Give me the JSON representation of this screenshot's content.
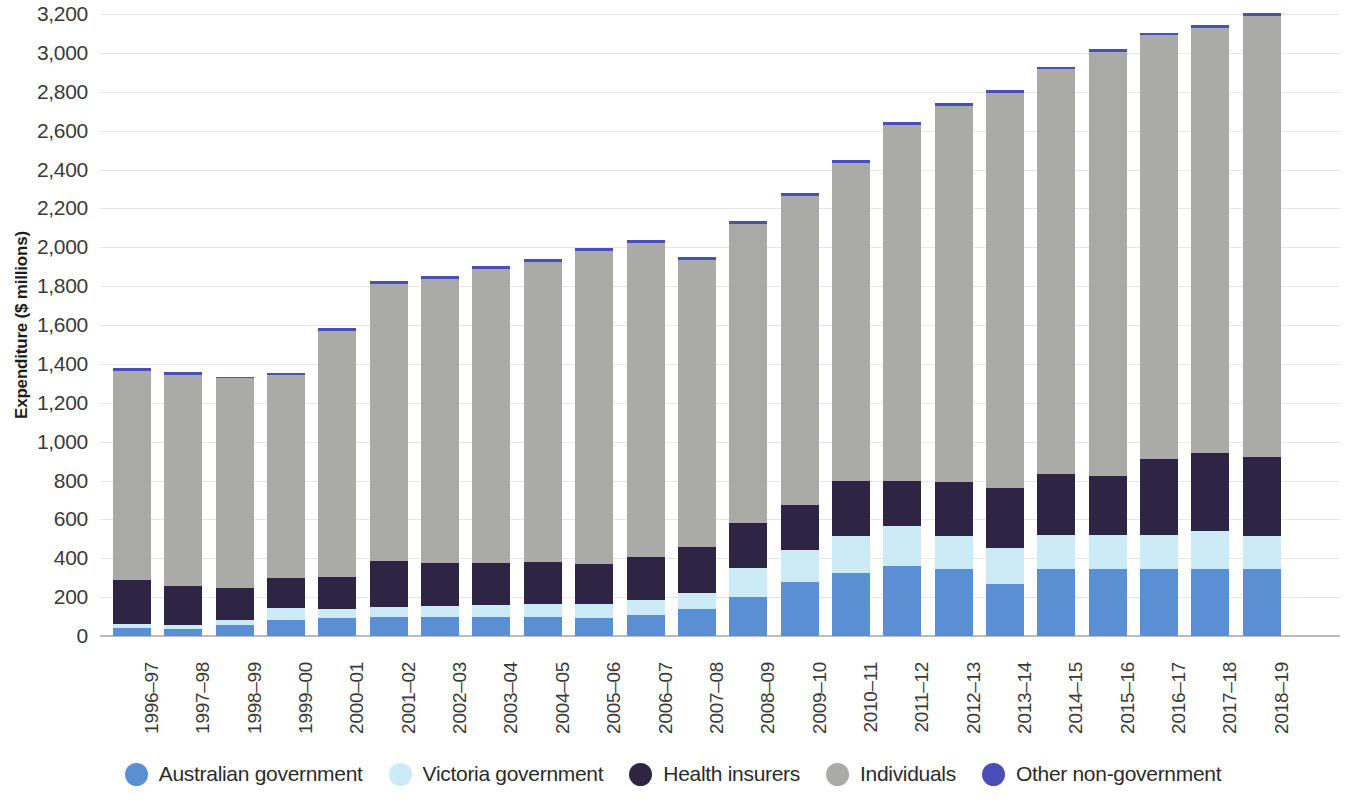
{
  "chart_data": {
    "type": "bar",
    "stacked": true,
    "title": "",
    "xlabel": "",
    "ylabel": "Expenditure ($ millions)",
    "ylim": [
      0,
      3200
    ],
    "ytick_step": 200,
    "ytick_labels": [
      "0",
      "200",
      "400",
      "600",
      "800",
      "1,000",
      "1,200",
      "1,400",
      "1,600",
      "1,800",
      "2,000",
      "2,200",
      "2,400",
      "2,600",
      "2,800",
      "3,000",
      "3,200"
    ],
    "grid": true,
    "legend_position": "bottom",
    "categories": [
      "1996–97",
      "1997–98",
      "1998–99",
      "1999–00",
      "2000–01",
      "2001–02",
      "2002–03",
      "2003–04",
      "2004–05",
      "2005–06",
      "2006–07",
      "2007–08",
      "2008–09",
      "2009–10",
      "2010–11",
      "2011–12",
      "2012–13",
      "2013–14",
      "2014–15",
      "2015–16",
      "2016–17",
      "2017–18",
      "2018–19"
    ],
    "series": [
      {
        "name": "Australian government",
        "color": "#5b8fd4",
        "values": [
          40,
          35,
          55,
          80,
          95,
          100,
          100,
          100,
          100,
          95,
          110,
          140,
          200,
          280,
          325,
          360,
          345,
          270,
          345,
          345,
          345,
          345,
          345
        ]
      },
      {
        "name": "Victoria government",
        "color": "#cdeaf7",
        "values": [
          20,
          20,
          25,
          65,
          45,
          50,
          55,
          60,
          65,
          70,
          75,
          80,
          150,
          160,
          190,
          205,
          170,
          185,
          175,
          175,
          175,
          195,
          170
        ]
      },
      {
        "name": "Health insurers",
        "color": "#2e2545",
        "values": [
          230,
          200,
          165,
          155,
          165,
          235,
          220,
          215,
          215,
          205,
          220,
          240,
          230,
          235,
          280,
          230,
          280,
          305,
          315,
          305,
          390,
          400,
          405
        ]
      },
      {
        "name": "Individuals",
        "color": "#aaaaa8",
        "values": [
          1075,
          1090,
          1080,
          1045,
          1265,
          1425,
          1460,
          1515,
          1545,
          1610,
          1615,
          1475,
          1540,
          1590,
          1640,
          1835,
          1930,
          2035,
          2080,
          2180,
          2180,
          2190,
          2270
        ]
      },
      {
        "name": "Other non-government",
        "color": "#4a4fb5",
        "values": [
          15,
          15,
          10,
          10,
          15,
          15,
          15,
          15,
          15,
          15,
          15,
          15,
          15,
          15,
          15,
          15,
          15,
          15,
          15,
          15,
          15,
          15,
          15
        ]
      }
    ],
    "totals": [
      1380,
      1360,
      1335,
      1355,
      1585,
      1825,
      1850,
      1905,
      1940,
      1995,
      2035,
      1950,
      2135,
      2280,
      2450,
      2645,
      2740,
      2810,
      2930,
      3020,
      3105,
      3145,
      3205
    ]
  },
  "legend": {
    "items": [
      {
        "label": "Australian government",
        "color": "#5b8fd4"
      },
      {
        "label": "Victoria government",
        "color": "#cdeaf7"
      },
      {
        "label": "Health insurers",
        "color": "#2e2545"
      },
      {
        "label": "Individuals",
        "color": "#aaaaa8"
      },
      {
        "label": "Other non-government",
        "color": "#4a4fb5"
      }
    ]
  }
}
